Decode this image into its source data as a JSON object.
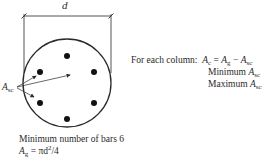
{
  "diagram": {
    "dimension_label": "d",
    "bar_label": {
      "symbol": "A",
      "subscript": "sc"
    },
    "num_bars": 6,
    "colors": {
      "line": "#2a2a2a",
      "bar": "#111111",
      "background": "#ffffff"
    }
  },
  "formulas": {
    "lead": "For each column:",
    "ac_eq": {
      "lhs": "A",
      "lhs_sub": "c",
      "eq": " = ",
      "a": "A",
      "a_sub": "g",
      "minus": " − ",
      "b": "A",
      "b_sub": "sc"
    },
    "min_line": {
      "text": "Minimum ",
      "symbol": "A",
      "sub": "sc"
    },
    "max_line": {
      "text": "Maximum ",
      "symbol": "A",
      "sub": "sc"
    }
  },
  "notes": {
    "min_bars": "Minimum number of bars 6",
    "ag_formula": {
      "symbol": "A",
      "sub": "g",
      "rhs": " = πd",
      "sup": "2",
      "tail": "/4"
    }
  }
}
